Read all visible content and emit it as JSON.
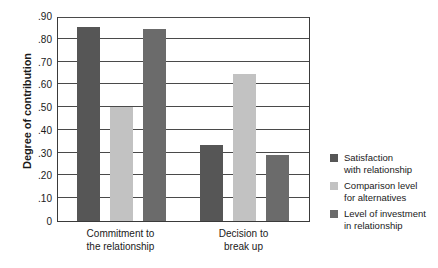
{
  "chart_data": {
    "type": "bar",
    "title": "",
    "xlabel": "",
    "ylabel": "Degree of contribution",
    "ylim": [
      0,
      0.9
    ],
    "grid": true,
    "legend_position": "right",
    "categories": [
      "Commitment to the relationship",
      "Decision to break up"
    ],
    "category_lines": [
      [
        "Commitment to",
        "the relationship"
      ],
      [
        "Decision to",
        "break up"
      ]
    ],
    "y_ticks": [
      ".90",
      ".80",
      ".70",
      ".60",
      ".50",
      ".40",
      ".30",
      ".20",
      ".10",
      "0"
    ],
    "y_tick_values": [
      0.9,
      0.8,
      0.7,
      0.6,
      0.5,
      0.4,
      0.3,
      0.2,
      0.1,
      0
    ],
    "series": [
      {
        "name": "Satisfaction with relationship",
        "name_lines": [
          "Satisfaction",
          "with relationship"
        ],
        "color": "#565656",
        "values": [
          0.85,
          0.335
        ]
      },
      {
        "name": "Comparison level for alternatives",
        "name_lines": [
          "Comparison level",
          "for alternatives"
        ],
        "color": "#c2c2c2",
        "values": [
          0.5,
          0.645
        ]
      },
      {
        "name": "Level of investment in relationship",
        "name_lines": [
          "Level of investment",
          "in relationship"
        ],
        "color": "#6b6b6b",
        "values": [
          0.845,
          0.29
        ]
      }
    ]
  }
}
